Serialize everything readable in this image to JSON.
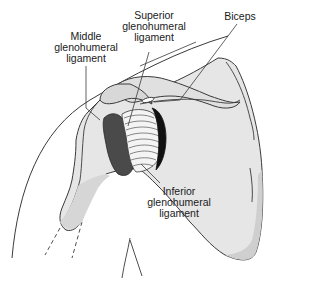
{
  "diagram": {
    "colors": {
      "outline": "#3a3a3a",
      "bone_fill": "#e4e4e4",
      "bone_shadow": "#cfcfcf",
      "dark_ligament": "#4a4a4a",
      "black_ligament": "#111111",
      "background": "#ffffff"
    },
    "labels": [
      {
        "id": "middle",
        "lines": [
          "Middle",
          "glenohumeral",
          "ligament"
        ]
      },
      {
        "id": "superior",
        "lines": [
          "Superior",
          "glenohumeral",
          "ligament"
        ]
      },
      {
        "id": "biceps",
        "lines": [
          "Biceps"
        ]
      },
      {
        "id": "inferior",
        "lines": [
          "Inferior",
          "glenohumeral",
          "ligament"
        ]
      }
    ]
  }
}
